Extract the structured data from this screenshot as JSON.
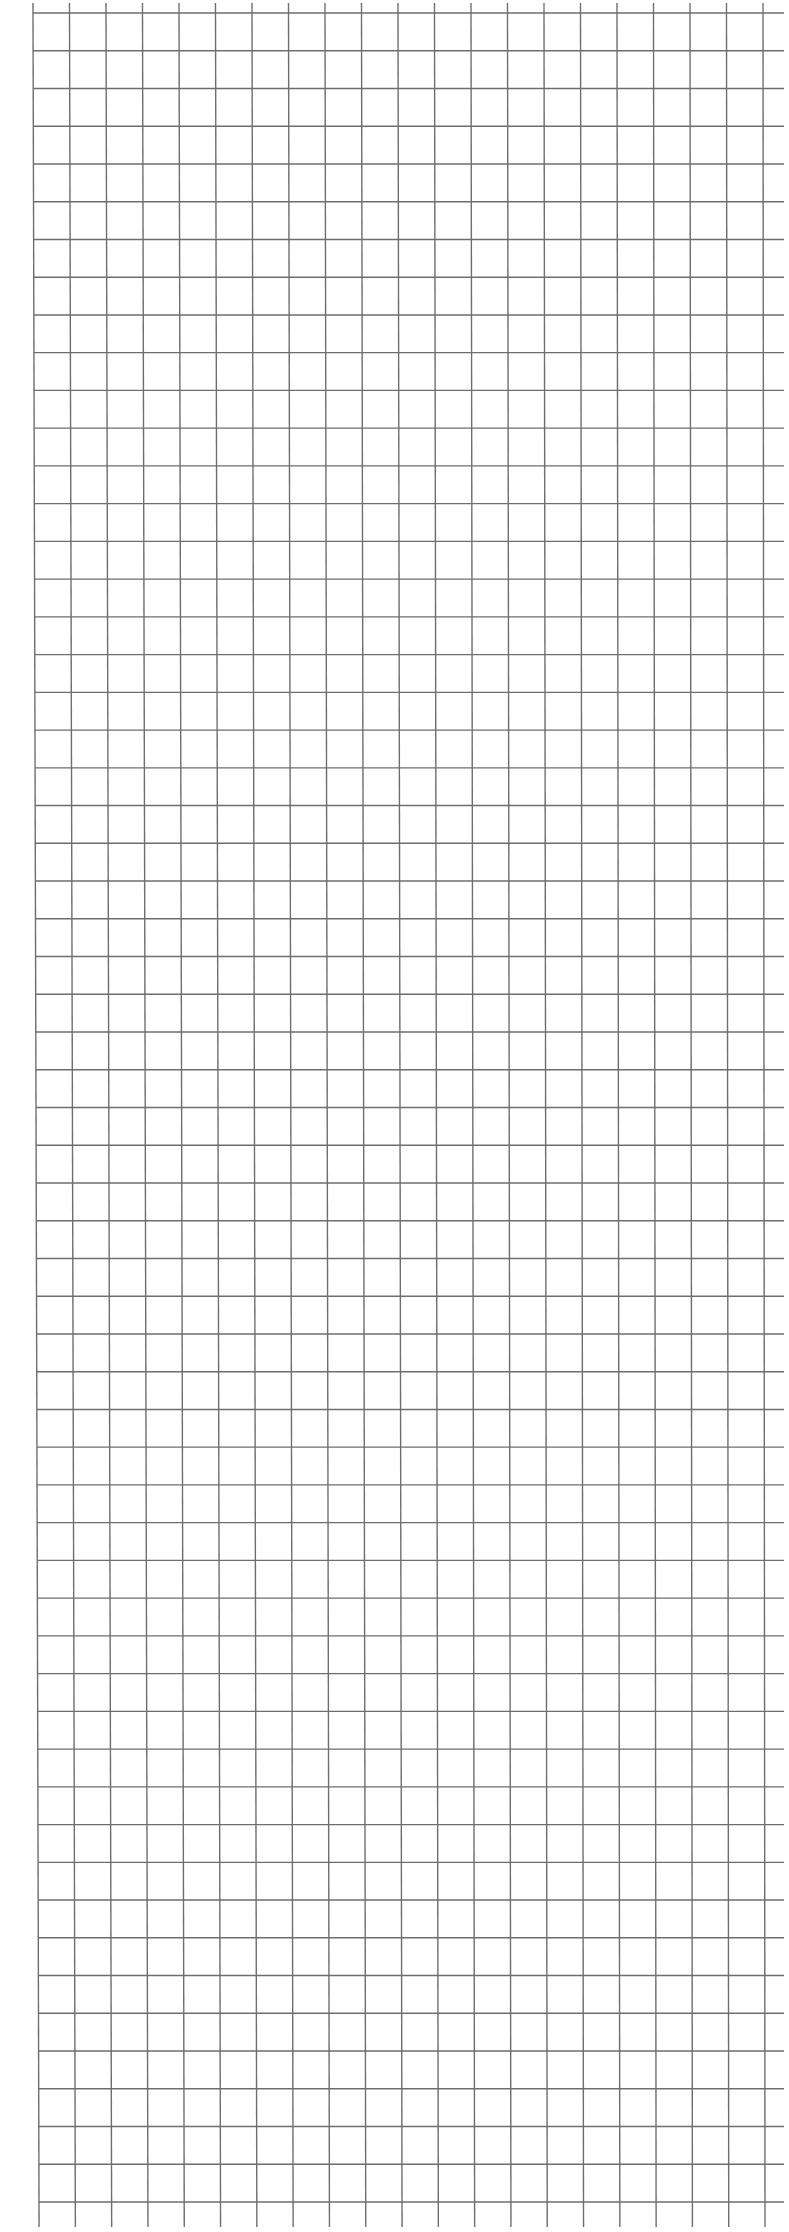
{
  "canvas": {
    "width": 789,
    "height": 2232,
    "background": "#ffffff"
  },
  "grid": {
    "line_color": "#6e6e6e",
    "line_width": 1.4,
    "columns": 21,
    "rows": 59,
    "top_left": {
      "x": 33,
      "y": 13
    },
    "bottom_left": {
      "x": 39,
      "y": 2202
    },
    "top_right": {
      "x": 763,
      "y": 13
    },
    "bottom_right": {
      "x": 765,
      "y": 2202
    },
    "horizontal_extend_right": 784,
    "vertical_top": 3,
    "vertical_bottom": 2227
  }
}
